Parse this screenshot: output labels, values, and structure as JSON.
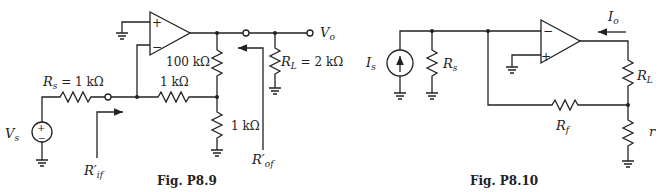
{
  "figures": [
    {
      "caption": "Fig. P8.9",
      "labels": {
        "source": "V",
        "source_sub": "s",
        "rs": "R",
        "rs_sub": "s",
        "rs_value": " = 1 kΩ",
        "r_feedback_series": "1 kΩ",
        "r_100k": "100 kΩ",
        "r_shunt": "1 kΩ",
        "rl": "R",
        "rl_sub": "L",
        "rl_value": " = 2 kΩ",
        "output": "V",
        "output_sub": "o",
        "rif": "R′",
        "rif_sub": "if",
        "rof": "R′",
        "rof_sub": "of",
        "plus": "+",
        "minus": "−"
      }
    },
    {
      "caption": "Fig. P8.10",
      "labels": {
        "source": "I",
        "source_sub": "s",
        "rs": "R",
        "rs_sub": "s",
        "rl": "R",
        "rl_sub": "L",
        "rf": "R",
        "rf_sub": "f",
        "r": "r",
        "output_current": "I",
        "output_current_sub": "o",
        "plus": "+",
        "minus": "−"
      }
    }
  ]
}
